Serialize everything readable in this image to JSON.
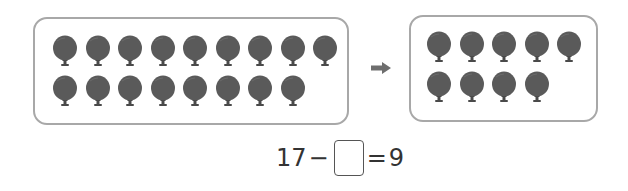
{
  "colors": {
    "balloon": "#5a5a5a",
    "balloon_shade": "#4a4a4a",
    "box_border": "#a8a8a8",
    "arrow": "#6e6e6e",
    "text": "#333333"
  },
  "left_group": {
    "count": 17,
    "rows": [
      9,
      8
    ]
  },
  "right_group": {
    "count": 9,
    "rows": [
      5,
      4
    ]
  },
  "arrow": {
    "icon": "right-arrow-icon"
  },
  "equation": {
    "minuend": "17",
    "minus": "−",
    "answer": "",
    "equals": "=",
    "result": "9"
  }
}
